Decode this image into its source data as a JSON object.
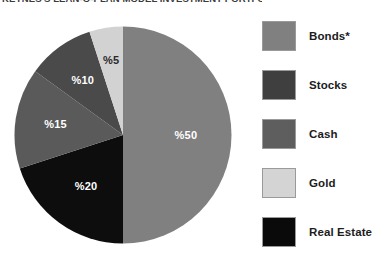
{
  "chart_data": {
    "type": "pie",
    "title": "KEYNES'S LEAN-O-PLAN MODEL INVESTMENT PORTFOLIO",
    "xlabel": "",
    "ylabel": "",
    "legend_position": "right",
    "grid": false,
    "categories": [
      "Bonds*",
      "Stocks",
      "Cash",
      "Gold",
      "Real Estate"
    ],
    "values": [
      50,
      10,
      15,
      5,
      20
    ],
    "value_labels": [
      "%50",
      "%10",
      "%15",
      "%5",
      "%20"
    ],
    "slice_colors": [
      "#808080",
      "#4a4a4a",
      "#5a5a5a",
      "#d2d2d2",
      "#0d0d0d"
    ],
    "label_text_colors": [
      "#ffffff",
      "#ffffff",
      "#ffffff",
      "#2a2a2a",
      "#ffffff"
    ],
    "start_angle_deg": 0,
    "direction": "clockwise",
    "slices": [
      {
        "name": "Bonds*",
        "value": 50,
        "label": "%50",
        "color": "#808080",
        "label_color": "#ffffff"
      },
      {
        "name": "Real Estate",
        "value": 20,
        "label": "%20",
        "color": "#0d0d0d",
        "label_color": "#ffffff"
      },
      {
        "name": "Cash",
        "value": 15,
        "label": "%15",
        "color": "#5a5a5a",
        "label_color": "#ffffff"
      },
      {
        "name": "Stocks",
        "value": 10,
        "label": "%10",
        "color": "#4a4a4a",
        "label_color": "#ffffff"
      },
      {
        "name": "Gold",
        "value": 5,
        "label": "%5",
        "color": "#d2d2d2",
        "label_color": "#2a2a2a"
      }
    ]
  },
  "legend": {
    "items": [
      {
        "label": "Bonds*",
        "color": "#808080"
      },
      {
        "label": "Stocks",
        "color": "#3f3f3f"
      },
      {
        "label": "Cash",
        "color": "#5e5e5e"
      },
      {
        "label": "Gold",
        "color": "#d4d4d4"
      },
      {
        "label": "Real Estate",
        "color": "#0a0a0a"
      }
    ]
  },
  "colors": {
    "background": "#ffffff",
    "text": "#1c1c1c",
    "swatch_border": "#9a9a9a"
  }
}
